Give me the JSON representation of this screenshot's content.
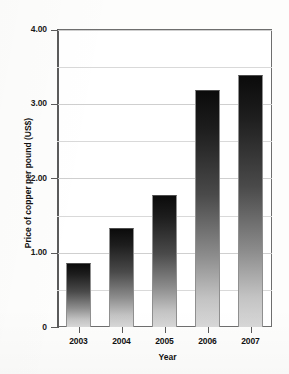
{
  "chart_data": {
    "type": "bar",
    "title": "",
    "xlabel": "Year",
    "ylabel": "Price of copper per pound (US$)",
    "categories": [
      "2003",
      "2004",
      "2005",
      "2006",
      "2007"
    ],
    "values": [
      0.86,
      1.33,
      1.78,
      3.18,
      3.39
    ],
    "ylim": [
      0,
      4.0
    ],
    "xlim_categories": 5,
    "y_major_ticks": [
      0,
      1.0,
      2.0,
      3.0,
      4.0
    ],
    "y_major_tick_labels": [
      "0",
      "1.00",
      "2.00",
      "3.00",
      "4.00"
    ],
    "y_minor_gridlines": [
      0.5,
      1.5,
      2.5,
      3.5
    ],
    "grid": "horizontal",
    "legend": "none",
    "bar_style": "vertical gradient dark-top to light-bottom",
    "colors": {
      "bar_top": "#0b0b0b",
      "bar_bottom": "#d8d8d8",
      "axis": "#5b5b5b",
      "gridline": "#d9d9d9",
      "text": "#111111",
      "background": "#ffffff"
    }
  }
}
